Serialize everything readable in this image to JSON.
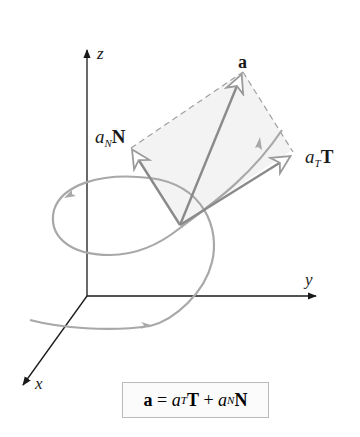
{
  "figure": {
    "axes": {
      "x_label": "x",
      "y_label": "y",
      "z_label": "z"
    },
    "vectors": {
      "a": {
        "symbol": "a"
      },
      "normal": {
        "coef": "a",
        "sub": "N",
        "unit": "N"
      },
      "tangential": {
        "coef": "a",
        "sub": "T",
        "unit": "T"
      }
    },
    "formula": {
      "lhs": "a",
      "eq": " = ",
      "t_coef": "a",
      "t_sub": "T",
      "t_unit": "T",
      "plus": " + ",
      "n_coef": "a",
      "n_sub": "N",
      "n_unit": "N"
    },
    "colors": {
      "axis": "#1a1a1a",
      "curve": "#a8a8a8",
      "vector": "#8a8a8a",
      "dashed": "#9a9a9a",
      "plane_fill": "#f3f3f3"
    }
  }
}
